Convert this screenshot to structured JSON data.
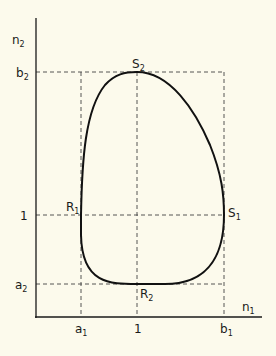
{
  "diagram": {
    "axes": {
      "y_label": "n",
      "y_sub": "2",
      "x_label": "n",
      "x_sub": "1"
    },
    "y_ticks": [
      {
        "label": "b",
        "sub": "2",
        "y": 72
      },
      {
        "label": "1",
        "sub": "",
        "y": 215
      },
      {
        "label": "a",
        "sub": "2",
        "y": 284
      }
    ],
    "x_ticks": [
      {
        "label": "a",
        "sub": "1",
        "x": 81
      },
      {
        "label": "1",
        "sub": "",
        "x": 137
      },
      {
        "label": "b",
        "sub": "1",
        "x": 224
      }
    ],
    "points": {
      "S2": {
        "label": "S",
        "sub": "2"
      },
      "S1": {
        "label": "S",
        "sub": "1"
      },
      "R1": {
        "label": "R",
        "sub": "1"
      },
      "R2": {
        "label": "R",
        "sub": "2"
      }
    },
    "colors": {
      "background": "#fcfaec",
      "ink": "#1a1a1a"
    }
  }
}
